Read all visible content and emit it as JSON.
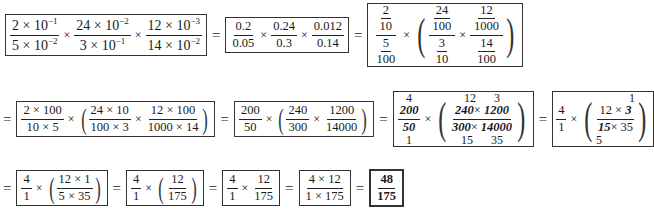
{
  "row1": {
    "box1": {
      "f1": {
        "num": "2 × 10",
        "num_exp": "−1",
        "den": "5 × 10",
        "den_exp": "−2"
      },
      "f2": {
        "num": "24 × 10",
        "num_exp": "−2",
        "den": "3 × 10",
        "den_exp": "−1"
      },
      "f3": {
        "num": "12 × 10",
        "num_exp": "−3",
        "den": "14 × 10",
        "den_exp": "−2"
      }
    },
    "box2": {
      "f1": {
        "num": "0.2",
        "den": "0.05"
      },
      "f2": {
        "num": "0.24",
        "den": "0.3"
      },
      "f3": {
        "num": "0.012",
        "den": "0.14"
      }
    },
    "box3": {
      "f1": {
        "num_num": "2",
        "num_den": "10",
        "den_num": "5",
        "den_den": "100"
      },
      "f2": {
        "num_num": "24",
        "num_den": "100",
        "den_num": "3",
        "den_den": "10"
      },
      "f3": {
        "num_num": "12",
        "num_den": "1000",
        "den_num": "14",
        "den_den": "100"
      }
    }
  },
  "row2": {
    "box1": {
      "f1": {
        "num": "2 × 100",
        "den": "10 × 5"
      },
      "f2": {
        "num": "24 × 10",
        "den": "100 × 3"
      },
      "f3": {
        "num": "12 × 100",
        "den": "1000 × 14"
      }
    },
    "box2": {
      "f1": {
        "num": "200",
        "den": "50"
      },
      "f2": {
        "num": "240",
        "den": "300"
      },
      "f3": {
        "num": "1200",
        "den": "14000"
      }
    },
    "box3": {
      "f1": {
        "top": "4",
        "num": "200",
        "den": "50",
        "bottom": "1"
      },
      "f2": {
        "top1": "12",
        "top2": "3",
        "num1": "240",
        "num2": "1200",
        "den1": "300",
        "den2": "14000",
        "bottom1": "15",
        "bottom2": "35"
      }
    },
    "box4": {
      "f1": {
        "num": "4",
        "den": "1"
      },
      "f2": {
        "top": "1",
        "num1": "12",
        "num2": "3",
        "den1": "15",
        "den2": "35",
        "bottom": "5"
      }
    }
  },
  "row3": {
    "box1": {
      "f1": {
        "num": "4",
        "den": "1"
      },
      "f2": {
        "num": "12 × 1",
        "den": "5 × 35"
      }
    },
    "box2": {
      "f1": {
        "num": "4",
        "den": "1"
      },
      "f2": {
        "num": "12",
        "den": "175"
      }
    },
    "box3": {
      "f1": {
        "num": "4",
        "den": "1"
      },
      "f2": {
        "num": "12",
        "den": "175"
      }
    },
    "box4": {
      "f1": {
        "num": "4 × 12",
        "den": "1 × 175"
      }
    },
    "box5": {
      "f1": {
        "num": "48",
        "den": "175"
      }
    }
  },
  "symbols": {
    "times": "×",
    "equals": "=",
    "lparen": "(",
    "rparen": ")",
    "cross_x": "×"
  }
}
